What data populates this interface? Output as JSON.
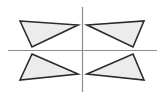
{
  "diagram": {
    "colors": {
      "background": "#ffffff",
      "axis": "#8c8c8c",
      "triangle_fill": "#ececec",
      "triangle_stroke": "#2a2a2a"
    },
    "axes": {
      "vertical": {
        "x1": 82.5,
        "y1": 7,
        "x2": 82.5,
        "y2": 92
      },
      "horizontal": {
        "x1": 8,
        "y1": 50.5,
        "x2": 157,
        "y2": 50.5
      }
    },
    "triangles": [
      {
        "quadrant": "top-left",
        "points": "20,21 78,25 32,47"
      },
      {
        "quadrant": "top-right",
        "points": "87,25 144,21 133,47"
      },
      {
        "quadrant": "bottom-left",
        "points": "32,54 78,74 20,80"
      },
      {
        "quadrant": "bottom-right",
        "points": "87,74 133,54 144,80"
      }
    ]
  }
}
